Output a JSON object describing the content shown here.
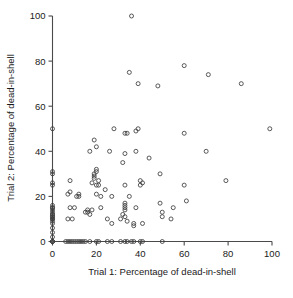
{
  "chart_data": {
    "type": "scatter",
    "title": "",
    "xlabel": "Trial 1: Percentage of dead-in-shell",
    "ylabel": "Trial 2: Percentage of dead-in-shell",
    "xlim": [
      0,
      100
    ],
    "ylim": [
      0,
      100
    ],
    "xticks": [
      0,
      20,
      40,
      60,
      80,
      100
    ],
    "yticks": [
      0,
      20,
      40,
      60,
      80,
      100
    ],
    "xticklabels": [
      "0",
      "20",
      "40",
      "60",
      "80",
      "100"
    ],
    "yticklabels": [
      "0",
      "20",
      "40",
      "60",
      "80",
      "100"
    ],
    "grid": false,
    "legend": null,
    "marker": "open-circle",
    "marker_color": "#3c3c3c",
    "series": [
      {
        "name": "dead-in-shell percentage pairs",
        "points": [
          [
            0,
            0
          ],
          [
            0,
            0
          ],
          [
            0,
            0
          ],
          [
            0,
            2
          ],
          [
            0,
            4
          ],
          [
            0,
            6
          ],
          [
            0,
            8
          ],
          [
            0,
            9
          ],
          [
            0,
            10
          ],
          [
            0,
            10
          ],
          [
            0,
            11
          ],
          [
            0,
            11
          ],
          [
            0,
            12
          ],
          [
            0,
            12
          ],
          [
            0,
            13
          ],
          [
            0,
            14
          ],
          [
            0,
            15
          ],
          [
            0,
            15
          ],
          [
            0,
            16
          ],
          [
            0,
            25
          ],
          [
            0,
            26
          ],
          [
            0,
            30
          ],
          [
            0,
            31
          ],
          [
            0,
            50
          ],
          [
            6,
            0
          ],
          [
            7,
            0
          ],
          [
            8,
            0
          ],
          [
            9,
            0
          ],
          [
            10,
            0
          ],
          [
            11,
            0
          ],
          [
            12,
            0
          ],
          [
            13,
            0
          ],
          [
            14,
            0
          ],
          [
            15,
            0
          ],
          [
            17,
            0
          ],
          [
            20,
            0
          ],
          [
            21,
            0
          ],
          [
            25,
            0
          ],
          [
            27,
            0
          ],
          [
            31,
            0
          ],
          [
            33,
            0
          ],
          [
            34,
            0
          ],
          [
            36,
            0
          ],
          [
            37,
            0
          ],
          [
            40,
            0
          ],
          [
            41,
            0
          ],
          [
            50,
            0
          ],
          [
            7,
            10
          ],
          [
            7,
            21
          ],
          [
            8,
            15
          ],
          [
            8,
            22
          ],
          [
            8,
            27
          ],
          [
            9,
            10
          ],
          [
            10,
            15
          ],
          [
            11,
            20
          ],
          [
            12,
            20
          ],
          [
            12,
            21
          ],
          [
            15,
            13
          ],
          [
            16,
            13
          ],
          [
            16,
            14
          ],
          [
            17,
            12
          ],
          [
            17,
            40
          ],
          [
            18,
            14
          ],
          [
            18,
            26
          ],
          [
            19,
            28
          ],
          [
            19,
            29
          ],
          [
            19,
            30
          ],
          [
            19,
            45
          ],
          [
            20,
            21
          ],
          [
            20,
            25
          ],
          [
            20,
            31
          ],
          [
            20,
            32
          ],
          [
            20,
            42
          ],
          [
            21,
            25
          ],
          [
            21,
            27
          ],
          [
            22,
            15
          ],
          [
            22,
            20
          ],
          [
            24,
            23
          ],
          [
            25,
            10
          ],
          [
            26,
            40
          ],
          [
            27,
            8
          ],
          [
            27,
            20
          ],
          [
            28,
            50
          ],
          [
            31,
            10
          ],
          [
            32,
            12
          ],
          [
            32,
            35
          ],
          [
            33,
            11
          ],
          [
            33,
            14
          ],
          [
            33,
            15
          ],
          [
            33,
            16
          ],
          [
            33,
            17
          ],
          [
            33,
            25
          ],
          [
            33,
            39
          ],
          [
            33,
            48
          ],
          [
            34,
            9
          ],
          [
            34,
            48
          ],
          [
            35,
            20
          ],
          [
            35,
            75
          ],
          [
            36,
            100
          ],
          [
            37,
            7
          ],
          [
            37,
            8
          ],
          [
            38,
            15
          ],
          [
            38,
            40
          ],
          [
            38,
            49
          ],
          [
            39,
            50
          ],
          [
            39,
            70
          ],
          [
            40,
            25
          ],
          [
            40,
            27
          ],
          [
            41,
            26
          ],
          [
            41,
            8
          ],
          [
            44,
            37
          ],
          [
            48,
            69
          ],
          [
            49,
            17
          ],
          [
            49,
            30
          ],
          [
            50,
            13
          ],
          [
            50,
            11
          ],
          [
            54,
            10
          ],
          [
            55,
            15
          ],
          [
            60,
            25
          ],
          [
            60,
            48
          ],
          [
            60,
            78
          ],
          [
            61,
            18
          ],
          [
            70,
            40
          ],
          [
            71,
            74
          ],
          [
            79,
            27
          ],
          [
            86,
            70
          ],
          [
            99,
            50
          ]
        ]
      }
    ]
  },
  "figure": {
    "x_axis_title": "Trial 1: Percentage of dead-in-shell",
    "y_axis_title": "Trial 2: Percentage of dead-in-shell"
  }
}
